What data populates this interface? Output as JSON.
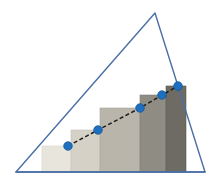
{
  "figure": {
    "title": "Staircase approximation under a triangle",
    "background_color": "#ffffff",
    "width": 222,
    "height": 187
  },
  "triangle": {
    "name": "triangle-outline",
    "stroke_color": "#4a6fa5",
    "stroke_width": 1.4,
    "fill": "none",
    "apex": {
      "x": 155,
      "y": 13
    },
    "bottom_left": {
      "x": 16,
      "y": 172
    },
    "bottom_right": {
      "x": 205,
      "y": 172
    },
    "points": "155,13 205,172 16,172"
  },
  "baseline": {
    "name": "baseline",
    "stroke_color": "#4a6fa5",
    "stroke_width": 1.6,
    "x1": 16,
    "y1": 172,
    "x2": 205,
    "y2": 172
  },
  "bars": {
    "name": "staircase-bars",
    "baseline_y": 172,
    "count": 5,
    "items": [
      {
        "label": "bar-1",
        "x": 42,
        "width": 29,
        "top": 146,
        "height": 26,
        "fill": "#e8e5dd",
        "edge": "#d8d5cc"
      },
      {
        "label": "bar-2",
        "x": 71,
        "width": 29,
        "top": 130,
        "height": 42,
        "fill": "#d5d1c7",
        "edge": "#c5c1b7"
      },
      {
        "label": "bar-3",
        "x": 100,
        "width": 40,
        "top": 108,
        "height": 64,
        "fill": "#b9b5ab",
        "edge": "#a9a59b"
      },
      {
        "label": "bar-4",
        "x": 140,
        "width": 26,
        "top": 95,
        "height": 77,
        "fill": "#8f8c84",
        "edge": "#7f7c74"
      },
      {
        "label": "bar-5",
        "x": 166,
        "width": 20,
        "top": 86,
        "height": 86,
        "fill": "#6d6b63",
        "edge": "#5d5b53"
      }
    ]
  },
  "trend_line": {
    "name": "dashed-trend-line",
    "stroke_color": "#1c1c1c",
    "stroke_width": 1.5,
    "dash_pattern": "4 2.5",
    "path": "68,146 98,130 140,108 162,95 178,86"
  },
  "markers": {
    "name": "data-point-markers",
    "fill_color": "#1f6fc0",
    "stroke_color": "#12538f",
    "radius": 4.3,
    "points": [
      {
        "label": "point-1",
        "x": 68,
        "y": 146
      },
      {
        "label": "point-2",
        "x": 98,
        "y": 130
      },
      {
        "label": "point-3",
        "x": 140,
        "y": 108
      },
      {
        "label": "point-4",
        "x": 162,
        "y": 95
      },
      {
        "label": "point-5",
        "x": 178,
        "y": 86
      }
    ]
  },
  "chart_data": {
    "type": "bar",
    "title": "Staircase approximation under a triangle",
    "subtitle": "",
    "xlabel": "",
    "ylabel": "",
    "categories": [
      "1",
      "2",
      "3",
      "4",
      "5"
    ],
    "values": [
      26,
      42,
      64,
      77,
      86
    ],
    "series": [
      {
        "name": "staircase-bars",
        "values": [
          26,
          42,
          64,
          77,
          86
        ]
      },
      {
        "name": "trend-line-points",
        "values": [
          26,
          42,
          64,
          77,
          86
        ]
      }
    ],
    "xlim": [
      16,
      205
    ],
    "ylim": [
      0,
      159
    ],
    "grid": false,
    "legend": false,
    "annotations": [
      "blue triangle outline encloses the staircase",
      "dashed black line connects five blue circular markers",
      "bar shading darkens from left to right"
    ]
  }
}
